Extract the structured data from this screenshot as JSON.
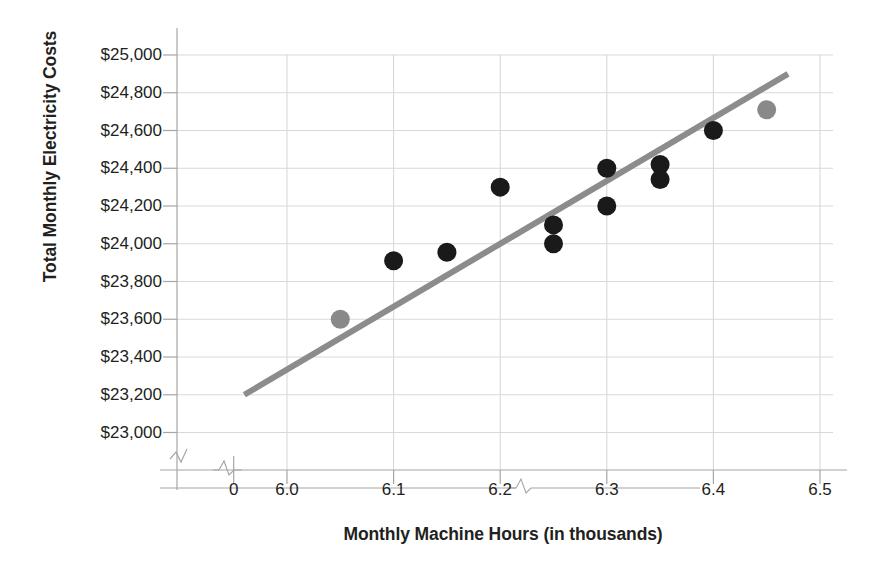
{
  "chart_data": {
    "type": "scatter",
    "title": "",
    "xlabel": "Monthly Machine Hours (in thousands)",
    "ylabel": "Total Monthly Electricity Costs",
    "grid": true,
    "legend": "none",
    "xlim": [
      5.95,
      6.5
    ],
    "ylim": [
      22900,
      25000
    ],
    "x_axis_break": true,
    "y_axis_break": true,
    "xticks": [
      "0",
      "6.0",
      "6.1",
      "6.2",
      "6.3",
      "6.4",
      "6.5"
    ],
    "xtick_values": [
      5.95,
      6.0,
      6.1,
      6.2,
      6.3,
      6.4,
      6.5
    ],
    "yticks": [
      "$23,000",
      "$23,200",
      "$23,400",
      "$23,600",
      "$23,800",
      "$24,000",
      "$24,200",
      "$24,400",
      "$24,600",
      "$24,800",
      "$25,000"
    ],
    "ytick_values": [
      23000,
      23200,
      23400,
      23600,
      23800,
      24000,
      24200,
      24400,
      24600,
      24800,
      25000
    ],
    "series": [
      {
        "name": "Observed data points",
        "marker": "circle",
        "color": "#1a1a1a",
        "points": [
          {
            "x": 6.1,
            "y": 23910
          },
          {
            "x": 6.15,
            "y": 23955
          },
          {
            "x": 6.2,
            "y": 24300
          },
          {
            "x": 6.25,
            "y": 24100
          },
          {
            "x": 6.25,
            "y": 24000
          },
          {
            "x": 6.3,
            "y": 24400
          },
          {
            "x": 6.3,
            "y": 24200
          },
          {
            "x": 6.35,
            "y": 24420
          },
          {
            "x": 6.35,
            "y": 24340
          },
          {
            "x": 6.4,
            "y": 24600
          }
        ]
      },
      {
        "name": "High-low endpoints",
        "marker": "circle",
        "color": "#898989",
        "points": [
          {
            "x": 6.05,
            "y": 23600
          },
          {
            "x": 6.45,
            "y": 24710
          }
        ]
      }
    ],
    "trendline": {
      "name": "High-low cost line",
      "color": "#8c8c8c",
      "width": 6,
      "x_start": 5.96,
      "y_start": 23200,
      "x_end": 6.47,
      "y_end": 24900
    }
  },
  "axis": {
    "y_title": "Total Monthly Electricity Costs",
    "x_title": "Monthly Machine Hours (in thousands)"
  },
  "colors": {
    "gridline": "#d9d9d9",
    "axis": "#a6a6a6",
    "marker_primary": "#1a1a1a",
    "marker_secondary": "#898989",
    "trendline": "#8c8c8c",
    "text": "#231f20",
    "background": "#ffffff"
  }
}
